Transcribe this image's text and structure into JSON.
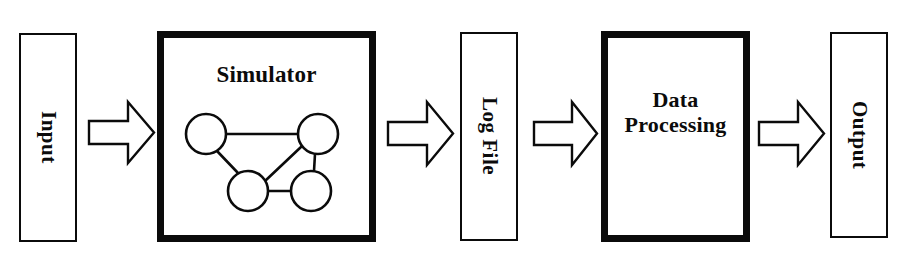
{
  "diagram": {
    "type": "block-flow-diagram",
    "canvas": {
      "width": 909,
      "height": 258,
      "background": "#ffffff"
    },
    "ink_color": "#0b0b0b",
    "stages": [
      {
        "id": "input",
        "label": "Input",
        "orientation": "vertical",
        "border": "thin",
        "x": 19,
        "y": 33,
        "w": 58,
        "h": 209
      },
      {
        "id": "simulator",
        "label": "Simulator",
        "orientation": "horizontal",
        "border": "thick",
        "x": 157,
        "y": 31,
        "w": 219,
        "h": 211,
        "contains": "network-graph"
      },
      {
        "id": "log-file",
        "label": "Log File",
        "orientation": "vertical",
        "border": "thin",
        "x": 460,
        "y": 32,
        "w": 58,
        "h": 209
      },
      {
        "id": "data-processing",
        "label_line1": "Data",
        "label_line2": "Processing",
        "orientation": "horizontal",
        "border": "thick",
        "x": 601,
        "y": 31,
        "w": 149,
        "h": 211
      },
      {
        "id": "output",
        "label": "Output",
        "orientation": "vertical",
        "border": "thin",
        "x": 830,
        "y": 32,
        "w": 58,
        "h": 206
      }
    ],
    "arrows": [
      {
        "id": "arrow-input-to-simulator",
        "from": "input",
        "to": "simulator",
        "x": 87,
        "y": 99,
        "w": 69,
        "h": 67,
        "direction": "right"
      },
      {
        "id": "arrow-simulator-to-log-file",
        "from": "simulator",
        "to": "log-file",
        "x": 386,
        "y": 99,
        "w": 69,
        "h": 69,
        "direction": "right"
      },
      {
        "id": "arrow-log-file-to-data-processing",
        "from": "log-file",
        "to": "data-processing",
        "x": 532,
        "y": 99,
        "w": 67,
        "h": 69,
        "direction": "right"
      },
      {
        "id": "arrow-data-processing-to-output",
        "from": "data-processing",
        "to": "output",
        "x": 757,
        "y": 99,
        "w": 69,
        "h": 69,
        "direction": "right"
      }
    ],
    "network_graph": {
      "description": "Four-node undirected network inside the Simulator box",
      "node_radius": 20,
      "nodes": [
        {
          "id": "n1",
          "cx": 206,
          "cy": 134
        },
        {
          "id": "n2",
          "cx": 318,
          "cy": 134
        },
        {
          "id": "n3",
          "cx": 248,
          "cy": 191
        },
        {
          "id": "n4",
          "cx": 311,
          "cy": 191
        }
      ],
      "edges": [
        {
          "from": "n1",
          "to": "n2"
        },
        {
          "from": "n1",
          "to": "n3"
        },
        {
          "from": "n2",
          "to": "n3"
        },
        {
          "from": "n2",
          "to": "n4"
        },
        {
          "from": "n3",
          "to": "n4"
        }
      ]
    }
  }
}
